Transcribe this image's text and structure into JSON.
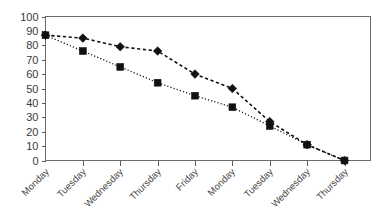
{
  "chart_data": {
    "type": "line",
    "title": "",
    "subtitle": "",
    "xlabel": "",
    "ylabel": "",
    "ylim": [
      0,
      100
    ],
    "yticks": [
      0,
      10,
      20,
      30,
      40,
      50,
      60,
      70,
      80,
      90,
      100
    ],
    "grid": false,
    "legend": "none",
    "categories": [
      "Monday",
      "Tuesday",
      "Wednesday",
      "Thursday",
      "Friday",
      "Monday",
      "Tuesday",
      "Wednesday",
      "Thursday"
    ],
    "series": [
      {
        "name": "Series 1",
        "marker": "diamond",
        "linestyle": "dashed",
        "color": "#111111",
        "values": [
          87,
          85,
          79,
          76,
          60,
          50,
          27,
          11,
          0
        ]
      },
      {
        "name": "Series 2",
        "marker": "square",
        "linestyle": "dotted",
        "color": "#111111",
        "values": [
          87,
          76,
          65,
          54,
          45,
          37,
          24,
          11,
          0
        ]
      }
    ],
    "axis_color": "#5a5a5a",
    "tick_label_color": "#3a3a3a",
    "background": "#ffffff"
  }
}
